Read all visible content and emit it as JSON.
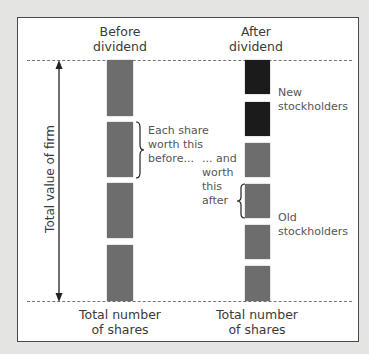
{
  "diagram": {
    "columns": [
      {
        "id": "before",
        "title_line1": "Before",
        "title_line2": "dividend",
        "share_count": 4,
        "share_color": "#6d6d6d",
        "bottom_label_line1": "Total number",
        "bottom_label_line2": "of shares"
      },
      {
        "id": "after",
        "title_line1": "After",
        "title_line2": "dividend",
        "share_count": 6,
        "new_share_count": 2,
        "old_share_count": 4,
        "new_share_color": "#1b1b1b",
        "old_share_color": "#6d6d6d",
        "bottom_label_line1": "Total number",
        "bottom_label_line2": "of shares"
      }
    ],
    "axis_label": "Total value of firm",
    "annotations": {
      "before_brace_line1": "Each share",
      "before_brace_line2": "worth this",
      "before_brace_line3": "before...",
      "after_brace_line1": "... and",
      "after_brace_line2": "worth",
      "after_brace_line3": "this",
      "after_brace_line4": "after",
      "new_label_line1": "New",
      "new_label_line2": "stockholders",
      "old_label_line1": "Old",
      "old_label_line2": "stockholders"
    }
  }
}
